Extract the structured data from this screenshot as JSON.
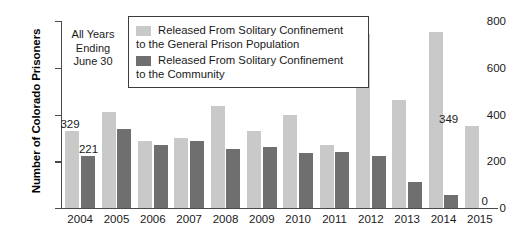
{
  "chart_data": {
    "type": "bar",
    "title": "",
    "xlabel": "",
    "ylabel": "Number of Colorado Prisoners",
    "ylim": [
      0,
      800
    ],
    "yticks": [
      0,
      200,
      400,
      600,
      800
    ],
    "grid": false,
    "legend_position": "top-center",
    "annotation": "All Years Ending June 30",
    "annotation_lines": [
      "All Years",
      "Ending",
      "June 30"
    ],
    "categories": [
      "2004",
      "2005",
      "2006",
      "2007",
      "2008",
      "2009",
      "2010",
      "2011",
      "2012",
      "2013",
      "2014",
      "2015"
    ],
    "series": [
      {
        "name": "Released From Solitary Confinement to the General Prison Population",
        "color": "#c9c9c9",
        "values": [
          329,
          410,
          285,
          300,
          435,
          330,
          400,
          270,
          744,
          460,
          752,
          349
        ]
      },
      {
        "name": "Released From Solitary Confinement to the Community",
        "color": "#6f6f6f",
        "values": [
          221,
          337,
          268,
          285,
          252,
          262,
          235,
          240,
          222,
          110,
          55,
          0
        ]
      }
    ],
    "data_labels": [
      {
        "text": "329",
        "series": 0,
        "category": "2004"
      },
      {
        "text": "221",
        "series": 1,
        "category": "2004"
      },
      {
        "text": "349",
        "series": 0,
        "category": "2015"
      },
      {
        "text": "0",
        "series": 1,
        "category": "2015"
      }
    ]
  },
  "legend": {
    "entries": [
      {
        "line1": "Released From Solitary Confinement",
        "line2": "to the General Prison Population",
        "swatch": "light"
      },
      {
        "line1": "Released From Solitary Confinement",
        "line2": "to the Community",
        "swatch": "dark"
      }
    ]
  },
  "colors": {
    "light_bar": "#c9c9c9",
    "dark_bar": "#6f6f6f",
    "axis": "#4a4a4a",
    "text": "#1a1a1a"
  }
}
